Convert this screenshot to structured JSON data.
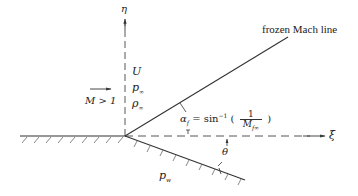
{
  "diagram": {
    "type": "supersonic flow over a compression corner",
    "axes": {
      "vertical_label": "η",
      "horizontal_label": "ξ"
    },
    "freestream": {
      "velocity_label": "U",
      "pressure_label": "p",
      "pressure_sub": "∞",
      "density_label": "ρ",
      "density_sub": "∞",
      "mach_condition": "M > 1"
    },
    "mach_line": {
      "label": "frozen Mach line",
      "angle_lhs": "α",
      "angle_lhs_sub": "f",
      "angle_eq": "= sin",
      "angle_sup": "−1",
      "paren_open": "(",
      "frac_num": "1",
      "frac_den": "M",
      "frac_den_sub": "f∞",
      "paren_close": ")"
    },
    "wall": {
      "deflection_angle_label": "θ",
      "wall_pressure_label": "p",
      "wall_pressure_sub": "w"
    },
    "colors": {
      "line": "#333333",
      "text": "#222222",
      "background": "#ffffff"
    }
  }
}
